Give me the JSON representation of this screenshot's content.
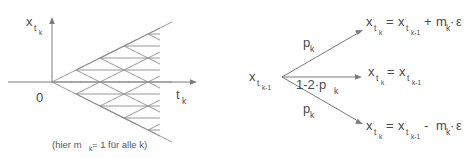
{
  "figure": {
    "title": "",
    "left_diagram": {
      "name": "trinomial-lattice",
      "y_axis_label": {
        "base": "x",
        "sub": "t",
        "sub2": "k"
      },
      "x_axis_label": {
        "base": "t",
        "sub": "k"
      },
      "origin_label": "0",
      "caption_parts": {
        "open": "(hier m",
        "sub": "k",
        "rest": " = 1 für alle k)"
      },
      "caption_full": "(hier m_k = 1 für alle k)",
      "steps": 5,
      "structure": "trinomial recombining lattice"
    },
    "right_diagram": {
      "name": "branching-probabilities",
      "source_node": {
        "base": "x",
        "sub": "t",
        "sub2": "k-1"
      },
      "branches": [
        {
          "id": "up",
          "probability": {
            "base": "p",
            "sub": "k"
          },
          "probability_text": "p_k",
          "outcome_text": "x_t_k = x_t_k-1 + m_k·ε",
          "outcome": {
            "lhs_base": "x",
            "lhs_sub": "t",
            "lhs_sub2": "k",
            "eq": "=",
            "rhs_base": "x",
            "rhs_sub": "t",
            "rhs_sub2": "k-1",
            "op": "+",
            "term_base": "m",
            "term_sub": "k",
            "dot": "·",
            "eps": "ε"
          }
        },
        {
          "id": "middle",
          "probability": {
            "base": "1-2·p",
            "sub": "k"
          },
          "probability_text": "1-2·p_k",
          "outcome_text": "x_t_k = x_t_k-1",
          "outcome": {
            "lhs_base": "x",
            "lhs_sub": "t",
            "lhs_sub2": "k",
            "eq": "=",
            "rhs_base": "x",
            "rhs_sub": "t",
            "rhs_sub2": "k-1",
            "op": "",
            "term_base": "",
            "term_sub": "",
            "dot": "",
            "eps": ""
          }
        },
        {
          "id": "down",
          "probability": {
            "base": "p",
            "sub": "k"
          },
          "probability_text": "p_k",
          "outcome_text": "x_t_k = x_t_k-1 - m_k·ε",
          "outcome": {
            "lhs_base": "x",
            "lhs_sub": "t",
            "lhs_sub2": "k",
            "eq": "=",
            "rhs_base": "x",
            "rhs_sub": "t",
            "rhs_sub2": "k-1",
            "op": "-",
            "term_base": "m",
            "term_sub": "k",
            "dot": "·",
            "eps": "ε"
          }
        }
      ]
    },
    "colors": {
      "line": "#7b7b7b",
      "lattice": "#8d8d8d",
      "text": "#4a4a4a",
      "background": "#ffffff"
    }
  }
}
